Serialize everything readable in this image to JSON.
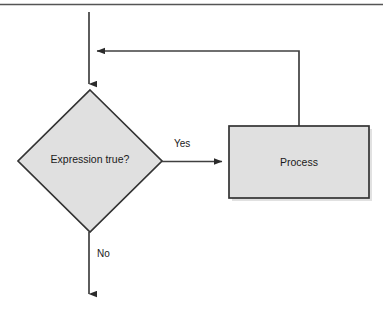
{
  "diagram": {
    "type": "flowchart",
    "background_color": "#ffffff",
    "shape_fill_color": "#e0e0e0",
    "shape_stroke_color": "#333333",
    "line_color": "#404040",
    "text_color": "#1a1a1a",
    "top_rule": {
      "name": "top-horizontal-rule",
      "color": "#555555"
    },
    "nodes": [
      {
        "id": "decision",
        "shape": "diamond",
        "label": "Expression true?",
        "x": 18,
        "y": 90,
        "width": 144,
        "height": 142
      },
      {
        "id": "process",
        "shape": "rectangle",
        "label": "Process",
        "x": 229,
        "y": 126,
        "width": 140,
        "height": 72
      }
    ],
    "edges": [
      {
        "id": "entry",
        "from": "top",
        "to": "decision",
        "label": "",
        "arrow": "down"
      },
      {
        "id": "yes-branch",
        "from": "decision",
        "to": "process",
        "label": "Yes",
        "arrow": "right"
      },
      {
        "id": "loop-back",
        "from": "process",
        "to": "entry",
        "label": "",
        "arrow": "left"
      },
      {
        "id": "no-branch",
        "from": "decision",
        "to": "exit",
        "label": "No",
        "arrow": "down"
      }
    ]
  }
}
